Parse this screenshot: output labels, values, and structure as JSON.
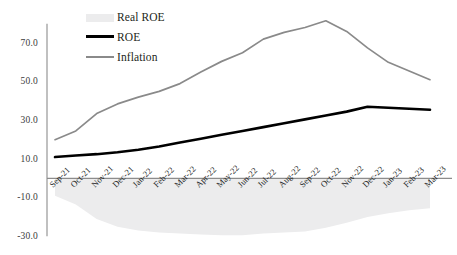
{
  "chart_data": {
    "type": "line",
    "title": "",
    "xlabel": "",
    "ylabel": "",
    "ylim": [
      -30.0,
      80.0
    ],
    "grid": false,
    "legend_position": "top-left",
    "categories": [
      "Sep-21",
      "Oct-21",
      "Nov-21",
      "Dec-21",
      "Jan-22",
      "Feb-22",
      "Mar-22",
      "Apr-22",
      "May-22",
      "Jun-22",
      "Jul-22",
      "Aug-22",
      "Sep-22",
      "Oct-22",
      "Nov-22",
      "Dec-22",
      "Jan-23",
      "Feb-23",
      "Mar-23"
    ],
    "ytick_labels": [
      "70.0",
      "50.0",
      "30.0",
      "10.0",
      "-10.0",
      "-30.0"
    ],
    "ytick_values": [
      70.0,
      50.0,
      30.0,
      10.0,
      -10.0,
      -30.0
    ],
    "series": [
      {
        "name": "Real ROE",
        "kind": "area",
        "color": "#ececed",
        "values": [
          -9.0,
          -13.5,
          -21.0,
          -25.0,
          -27.0,
          -28.0,
          -28.5,
          -29.0,
          -29.5,
          -29.5,
          -28.5,
          -28.0,
          -27.5,
          -25.5,
          -23.0,
          -20.0,
          -18.0,
          -16.5,
          -15.5
        ]
      },
      {
        "name": "ROE",
        "kind": "line",
        "color": "#000000",
        "values": [
          11.0,
          11.8,
          12.5,
          13.5,
          14.8,
          16.5,
          18.5,
          20.5,
          22.5,
          24.5,
          26.5,
          28.5,
          30.5,
          32.5,
          34.5,
          37.0,
          36.5,
          36.0,
          35.5
        ]
      },
      {
        "name": "Inflation",
        "kind": "line",
        "color": "#8a8a8a",
        "values": [
          20.0,
          24.5,
          33.5,
          38.5,
          42.0,
          45.0,
          49.0,
          55.0,
          60.5,
          65.0,
          72.0,
          75.5,
          78.0,
          81.5,
          76.0,
          67.5,
          60.0,
          55.5,
          51.0
        ]
      }
    ]
  },
  "legend": {
    "items": [
      {
        "label": "Real ROE",
        "style": "area"
      },
      {
        "label": "ROE",
        "style": "line-black"
      },
      {
        "label": "Inflation",
        "style": "line-gray"
      }
    ]
  },
  "colors": {
    "area_fill": "#ececed",
    "roe_line": "#000000",
    "inflation_line": "#8a8a8a",
    "axis": "#8c8c8c",
    "text": "#231f20",
    "background": "#ffffff"
  }
}
